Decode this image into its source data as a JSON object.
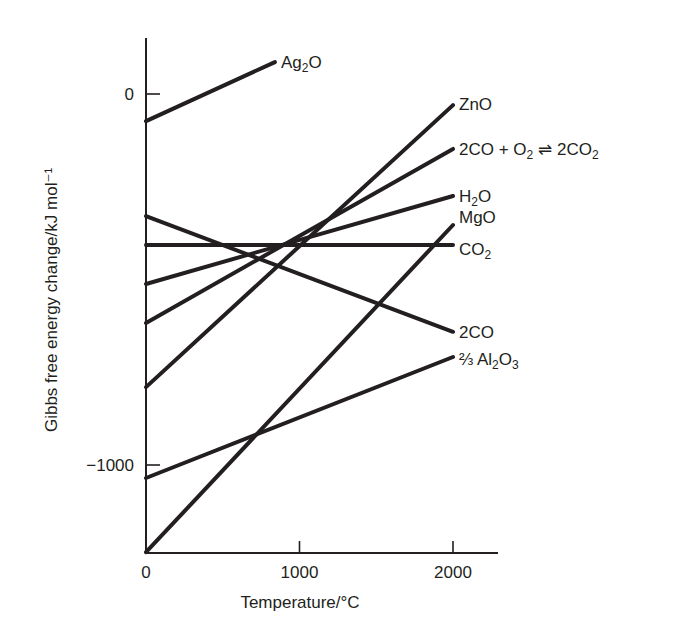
{
  "chart_data": {
    "type": "line",
    "title": "",
    "xlabel": "Temperature/°C",
    "ylabel": "Gibbs free energy change/kJ mol⁻¹",
    "xlim": [
      0,
      2300
    ],
    "ylim": [
      -1237,
      150
    ],
    "x_ticks": [
      0,
      1000,
      2000
    ],
    "x_tick_labels": [
      "0",
      "1000",
      "2000"
    ],
    "y_ticks": [
      0,
      -1000
    ],
    "y_tick_labels": [
      "0",
      "−1000"
    ],
    "grid": false,
    "legend": "inline labels at right end of each line",
    "series": [
      {
        "name": "Ag2O",
        "label_html": "Ag<tspan class='sub' dy='4'>2</tspan><tspan dy='-4'>O</tspan>",
        "x": [
          0,
          840
        ],
        "y": [
          -73,
          86
        ]
      },
      {
        "name": "ZnO",
        "label_html": "ZnO",
        "x": [
          0,
          2000
        ],
        "y": [
          -790,
          -30
        ]
      },
      {
        "name": "2CO + O2 ⇌ 2CO2",
        "label_html": "2CO + O<tspan class='sub' dy='4'>2</tspan><tspan dy='-4'> ⇌ 2CO</tspan><tspan class='sub' dy='4'>2</tspan>",
        "x": [
          0,
          2000
        ],
        "y": [
          -617,
          -148
        ]
      },
      {
        "name": "H2O",
        "label_html": "H<tspan class='sub' dy='4'>2</tspan><tspan dy='-4'>O</tspan>",
        "x": [
          0,
          2000
        ],
        "y": [
          -512,
          -275
        ]
      },
      {
        "name": "MgO",
        "label_html": "MgO",
        "x": [
          0,
          2000
        ],
        "y": [
          -1235,
          -353
        ]
      },
      {
        "name": "CO2",
        "label_html": "CO<tspan class='sub' dy='4'>2</tspan>",
        "x": [
          0,
          2000
        ],
        "y": [
          -407,
          -407
        ]
      },
      {
        "name": "2CO",
        "label_html": "2CO",
        "x": [
          0,
          2000
        ],
        "y": [
          -329,
          -641
        ]
      },
      {
        "name": "2/3 Al2O3",
        "label_html": "⅔ Al<tspan class='sub' dy='4'>2</tspan><tspan dy='-4'>O</tspan><tspan class='sub' dy='4'>3</tspan>",
        "x": [
          0,
          2000
        ],
        "y": [
          -1035,
          -709
        ]
      }
    ]
  },
  "labels": {
    "xlabel": "Temperature/°C",
    "ylabel": "Gibbs free energy change/kJ mol⁻¹"
  }
}
